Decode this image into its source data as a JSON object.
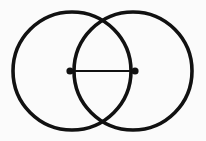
{
  "figure": {
    "title": "Two overlapping circles (vesica piscis) with horizontal chord",
    "canvas": {
      "width": 206,
      "height": 141,
      "background_color": "#fbfbfb"
    },
    "style": {
      "stroke_color": "#111111",
      "circle_stroke_width": 3.6,
      "chord_stroke_width": 2.2,
      "fill": "none",
      "dot_color": "#111111",
      "dot_radius": 3.6
    },
    "shapes": {
      "left_circle": {
        "label": "Left circle",
        "center_x": 72,
        "center_y": 71,
        "radius": 59
      },
      "right_circle": {
        "label": "Right circle",
        "center_x": 133,
        "center_y": 71,
        "radius": 59
      },
      "chord": {
        "label": "Horizontal chord",
        "x1": 70,
        "y1": 71,
        "x2": 135,
        "y2": 71
      },
      "left_endpoint_dot": {
        "label": "Left chord endpoint",
        "cx": 70,
        "cy": 71
      },
      "right_endpoint_dot": {
        "label": "Right chord endpoint",
        "cx": 135,
        "cy": 71
      },
      "top_intersection": {
        "label": "Upper circle intersection",
        "x": 102.5,
        "y": 21
      },
      "bottom_intersection": {
        "label": "Lower circle intersection",
        "x": 102.5,
        "y": 121
      }
    }
  }
}
